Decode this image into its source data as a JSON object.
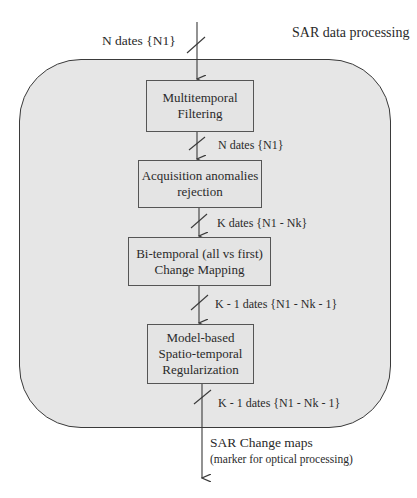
{
  "diagram": {
    "title": "SAR data processing",
    "colors": {
      "container_fill": "#e6e6e6",
      "box_fill": "#e4e4e4",
      "stroke": "#3a3a3a",
      "text": "#2a2a2a"
    },
    "input": {
      "label": "N dates {N1}"
    },
    "steps": [
      {
        "id": "step1",
        "lines": [
          "Multitemporal",
          "Filtering"
        ]
      },
      {
        "id": "step2",
        "lines": [
          "Acquisition anomalies",
          "rejection"
        ]
      },
      {
        "id": "step3",
        "lines": [
          "Bi-temporal (all vs first)",
          "Change Mapping"
        ]
      },
      {
        "id": "step4",
        "lines": [
          "Model-based",
          "Spatio-temporal",
          "Regularization"
        ]
      }
    ],
    "edges": [
      {
        "from": "input",
        "to": "step1",
        "label": "N dates {N1}"
      },
      {
        "from": "step1",
        "to": "step2",
        "label": "N dates {N1}"
      },
      {
        "from": "step2",
        "to": "step3",
        "label": "K dates {N1 - Nk}"
      },
      {
        "from": "step3",
        "to": "step4",
        "label": "K - 1 dates {N1 - Nk - 1}"
      },
      {
        "from": "step4",
        "to": "output",
        "label": "K - 1 dates {N1 - Nk - 1}"
      }
    ],
    "output": {
      "label": "SAR Change maps",
      "sublabel": "(marker for optical processing)"
    }
  }
}
